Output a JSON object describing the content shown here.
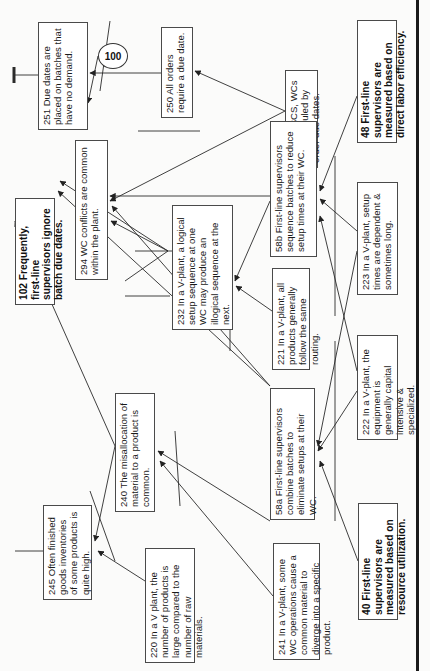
{
  "diagram": {
    "type": "current-reality-tree",
    "orientation": "rotated-90-ccw",
    "entities": [
      {
        "id": "251",
        "text": "251 Due dates are placed on batches that have no demand.",
        "bold": false
      },
      {
        "id": "100",
        "text": "100",
        "shape": "circle"
      },
      {
        "id": "250",
        "text": "250 All orders require a due date.",
        "bold": false
      },
      {
        "id": "211",
        "text": "211 In a SCS, WCs are scheduled by order due dates.",
        "bold": false
      },
      {
        "id": "48",
        "text": "48 First-line supervisors are measured based on direct labor efficiency.",
        "bold": true
      },
      {
        "id": "102",
        "text": "102 Frequently, first-line supervisors ignore batch due dates.",
        "bold": true
      },
      {
        "id": "294",
        "text": "294 WC conflicts are common within the plant.",
        "bold": false
      },
      {
        "id": "232",
        "text": "232  In a V-plant, a logical setup sequence at one WC may produce an illogical sequence at the next.",
        "bold": false
      },
      {
        "id": "58b",
        "text": "58b First-line supervisors sequence batches to reduce setup times at their WC.",
        "bold": false
      },
      {
        "id": "223",
        "text": "223 In a V-plant, setup times are dependent & sometimes long.",
        "bold": false
      },
      {
        "id": "221",
        "text": "221 In a V-plant, all products generally follow the same routing.",
        "bold": false
      },
      {
        "id": "222",
        "text": "222 In a V-plant, the equipment is generally capital intensive & specialized.",
        "bold": false
      },
      {
        "id": "58a",
        "text": "58a First-line supervisors combine batches to eliminate setups at their WC.",
        "bold": false
      },
      {
        "id": "240",
        "text": "240 The misallocation of material to a product is common.",
        "bold": false
      },
      {
        "id": "245",
        "text": "245 Often finished goods inventories of some products is quite high.",
        "bold": false
      },
      {
        "id": "220",
        "text": "220 In a V plant, the number of products is large compared to the number of raw materials.",
        "bold": false
      },
      {
        "id": "241",
        "text": "241 In a V-plant, some WC operations cause a common material to diverge into a specific product.",
        "bold": false
      },
      {
        "id": "40",
        "text": "40 First-line supervisors are measured based on resource utilization.",
        "bold": true
      }
    ],
    "links": [
      {
        "from": "100",
        "to": "251"
      },
      {
        "from": "250",
        "to": "251",
        "and_group": "A"
      },
      {
        "from": "211",
        "to": "250"
      },
      {
        "from": "211",
        "to": "294"
      },
      {
        "from": "58b",
        "to": "294",
        "and_group": "B"
      },
      {
        "from": "232",
        "to": "294",
        "and_group": "B"
      },
      {
        "from": "232",
        "to": "102"
      },
      {
        "from": "58a",
        "to": "294"
      },
      {
        "from": "58a",
        "to": "102"
      },
      {
        "from": "58b",
        "to": "232",
        "and_group": "C"
      },
      {
        "from": "221",
        "to": "232",
        "and_group": "C"
      },
      {
        "from": "48",
        "to": "58b",
        "and_group": "D"
      },
      {
        "from": "223",
        "to": "58b",
        "and_group": "D"
      },
      {
        "from": "222",
        "to": "58b",
        "and_group": "D"
      },
      {
        "from": "40",
        "to": "58a",
        "and_group": "E"
      },
      {
        "from": "222",
        "to": "58a",
        "and_group": "E"
      },
      {
        "from": "223",
        "to": "58a",
        "and_group": "E"
      },
      {
        "from": "58a",
        "to": "240",
        "and_group": "F"
      },
      {
        "from": "241",
        "to": "240",
        "and_group": "F"
      },
      {
        "from": "240",
        "to": "245",
        "and_group": "G"
      },
      {
        "from": "220",
        "to": "245",
        "and_group": "G"
      },
      {
        "from": "240",
        "to": "off-page"
      }
    ]
  },
  "colors": {
    "line": "#2a2a2a",
    "box_border": "#4a4a4a",
    "background": "#fbfbfa",
    "page_edge": "#1a1a1a"
  }
}
